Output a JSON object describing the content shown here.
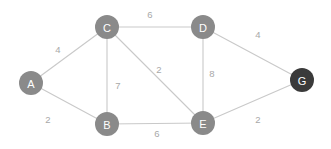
{
  "diagram": {
    "type": "weighted-graph",
    "background_color": "#ffffff",
    "edge_color": "#c9c9c9",
    "node_default_color": "#8a8a8a",
    "node_highlight_color": "#3a3a3a",
    "node_label_color": "#ffffff",
    "weight_label_color": "#a8a8a8",
    "node_radius": 12
  },
  "chart_data": {
    "type": "graph",
    "nodes": [
      {
        "id": "A",
        "label": "A",
        "x": 31,
        "y": 83,
        "color": "#8a8a8a",
        "highlighted": false
      },
      {
        "id": "B",
        "label": "B",
        "x": 107,
        "y": 124,
        "color": "#8a8a8a",
        "highlighted": false
      },
      {
        "id": "C",
        "label": "C",
        "x": 107,
        "y": 27,
        "color": "#8a8a8a",
        "highlighted": false
      },
      {
        "id": "D",
        "label": "D",
        "x": 203,
        "y": 27,
        "color": "#8a8a8a",
        "highlighted": false
      },
      {
        "id": "E",
        "label": "E",
        "x": 203,
        "y": 123,
        "color": "#8a8a8a",
        "highlighted": false
      },
      {
        "id": "G",
        "label": "G",
        "x": 302,
        "y": 80,
        "color": "#3a3a3a",
        "highlighted": true
      }
    ],
    "edges": [
      {
        "source": "A",
        "target": "C",
        "weight": 4,
        "label": "4",
        "label_x": 58,
        "label_y": 49
      },
      {
        "source": "A",
        "target": "B",
        "weight": 2,
        "label": "2",
        "label_x": 48,
        "label_y": 119
      },
      {
        "source": "C",
        "target": "D",
        "weight": 6,
        "label": "6",
        "label_x": 150,
        "label_y": 14
      },
      {
        "source": "C",
        "target": "B",
        "weight": 7,
        "label": "7",
        "label_x": 118,
        "label_y": 85
      },
      {
        "source": "C",
        "target": "E",
        "weight": 2,
        "label": "2",
        "label_x": 159,
        "label_y": 69
      },
      {
        "source": "D",
        "target": "E",
        "weight": 8,
        "label": "8",
        "label_x": 212,
        "label_y": 73
      },
      {
        "source": "D",
        "target": "G",
        "weight": 4,
        "label": "4",
        "label_x": 258,
        "label_y": 34
      },
      {
        "source": "B",
        "target": "E",
        "weight": 6,
        "label": "6",
        "label_x": 157,
        "label_y": 133
      },
      {
        "source": "E",
        "target": "G",
        "weight": 2,
        "label": "2",
        "label_x": 258,
        "label_y": 119
      }
    ]
  }
}
